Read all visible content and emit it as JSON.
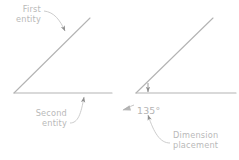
{
  "diagram": {
    "colors": {
      "entity_line": "#b3b3b3",
      "leader_line": "#c6c6c6",
      "text": "#b9b9b9",
      "dimension_text": "#b4b4b4",
      "background": "#ffffff"
    },
    "left_panel": {
      "name": "entity-selection-panel",
      "labels": {
        "first_entity_line1": "First",
        "first_entity_line2": "entity",
        "second_entity_line1": "Second",
        "second_entity_line2": "entity"
      },
      "geometry": {
        "vertex": [
          14,
          93
        ],
        "first_entity_end": [
          90,
          18
        ],
        "second_entity_end": [
          112,
          93
        ],
        "first_entity_arrow": [
          66,
          32
        ],
        "second_entity_arrow": [
          84,
          94
        ]
      }
    },
    "right_panel": {
      "name": "dimension-placement-panel",
      "labels": {
        "dimension_value": "135°",
        "placement_line1": "Dimension",
        "placement_line2": "placement"
      },
      "geometry": {
        "vertex": [
          136,
          93
        ],
        "first_entity_end": [
          213,
          18
        ],
        "second_entity_end": [
          236,
          93
        ],
        "placement_arrow": [
          148,
          93
        ],
        "leader_arrow": [
          147,
          112
        ],
        "arc_arrow": [
          124,
          110
        ]
      }
    }
  }
}
